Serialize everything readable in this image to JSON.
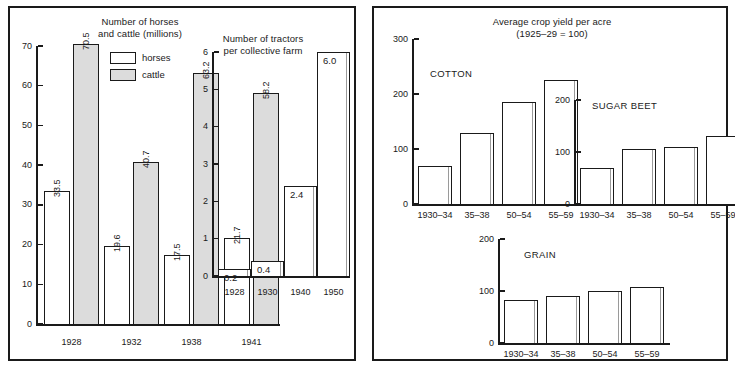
{
  "figure": {
    "background": "#ffffff",
    "ink": "#1a1a1a",
    "cattle_fill": "#dcdcdc"
  },
  "panels": {
    "left": {
      "name": "livestock-and-tractors-panel"
    },
    "right": {
      "name": "crop-yield-panel"
    }
  },
  "legend": {
    "horses_label": "horses",
    "cattle_label": "cattle"
  },
  "titles": {
    "livestock_line1": "Number of horses",
    "livestock_line2": "and cattle (millions)",
    "tractors_line1": "Number of tractors",
    "tractors_line2": "per collective farm",
    "cropyield_line1": "Average crop yield per acre",
    "cropyield_line2": "(1925–29 = 100)"
  },
  "captions": {
    "cotton": "COTTON",
    "sugar_beet": "SUGAR BEET",
    "grain": "GRAIN"
  },
  "chart_data": [
    {
      "id": "livestock",
      "type": "bar",
      "title": "Number of horses and cattle (millions)",
      "xlabel": "",
      "ylabel": "",
      "ylim": [
        0,
        70
      ],
      "yticks": [
        0,
        10,
        20,
        30,
        40,
        50,
        60,
        70
      ],
      "ytick_labels": [
        "0",
        "10",
        "20",
        "30",
        "40",
        "50",
        "60",
        "70"
      ],
      "categories": [
        "1928",
        "1932",
        "1938",
        "1941"
      ],
      "grid": false,
      "legend_position": "top-right",
      "series": [
        {
          "name": "horses",
          "values": [
            33.5,
            19.6,
            17.5,
            21.7
          ],
          "labels": [
            "33.5",
            "19.6",
            "17.5",
            "21.7"
          ],
          "fill": "#ffffff"
        },
        {
          "name": "cattle",
          "values": [
            70.5,
            40.7,
            63.2,
            58.2
          ],
          "labels": [
            "70.5",
            "40.7",
            "63.2",
            "58.2"
          ],
          "fill": "#dcdcdc"
        }
      ]
    },
    {
      "id": "tractors",
      "type": "bar",
      "title": "Number of tractors per collective farm",
      "xlabel": "",
      "ylabel": "",
      "ylim": [
        0,
        6
      ],
      "yticks": [
        0,
        1,
        2,
        3,
        4,
        5,
        6
      ],
      "ytick_labels": [
        "0",
        "1",
        "2",
        "3",
        "4",
        "5",
        "6"
      ],
      "categories": [
        "1928",
        "1930",
        "1940",
        "1950"
      ],
      "values": [
        0.2,
        0.4,
        2.4,
        6.0
      ],
      "labels": [
        "0.2",
        "0.4",
        "2.4",
        "6.0"
      ],
      "grid": false
    },
    {
      "id": "cotton",
      "type": "bar",
      "title": "COTTON",
      "xlabel": "",
      "ylabel": "",
      "ylim": [
        0,
        300
      ],
      "yticks": [
        0,
        100,
        200,
        300
      ],
      "ytick_labels": [
        "0",
        "100",
        "200",
        "300"
      ],
      "categories": [
        "1930–34",
        "35–38",
        "50–54",
        "55–59"
      ],
      "values": [
        70,
        130,
        185,
        225
      ],
      "grid": false
    },
    {
      "id": "sugar_beet",
      "type": "bar",
      "title": "SUGAR BEET",
      "xlabel": "",
      "ylabel": "",
      "ylim": [
        0,
        200
      ],
      "yticks": [
        0,
        100,
        200
      ],
      "ytick_labels": [
        "0",
        "100",
        "200"
      ],
      "categories": [
        "1930–34",
        "35–38",
        "50–54",
        "55–59"
      ],
      "values": [
        70,
        105,
        110,
        130
      ],
      "grid": false
    },
    {
      "id": "grain",
      "type": "bar",
      "title": "GRAIN",
      "xlabel": "",
      "ylabel": "",
      "ylim": [
        0,
        200
      ],
      "yticks": [
        0,
        100,
        200
      ],
      "ytick_labels": [
        "0",
        "100",
        "200"
      ],
      "categories": [
        "1930–34",
        "35–38",
        "50–54",
        "55–59"
      ],
      "values": [
        83,
        90,
        100,
        108
      ],
      "grid": false
    }
  ]
}
